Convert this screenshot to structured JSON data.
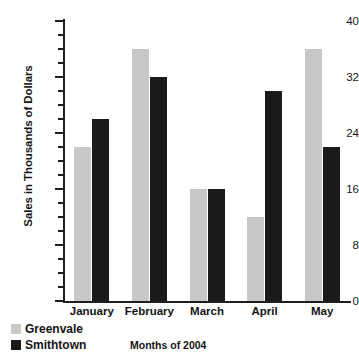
{
  "chart_data": {
    "type": "bar",
    "title": "",
    "xlabel": "Months of 2004",
    "ylabel": "Sales in Thousands of Dollars",
    "categories": [
      "January",
      "February",
      "March",
      "April",
      "May"
    ],
    "series": [
      {
        "name": "Greenvale",
        "color": "#c8c8c8",
        "values": [
          22,
          36,
          16,
          12,
          36
        ]
      },
      {
        "name": "Smithtown",
        "color": "#1a1a1a",
        "values": [
          26,
          32,
          16,
          30,
          22
        ]
      }
    ],
    "ylim": [
      0,
      40
    ],
    "y_major_ticks": [
      0,
      8,
      16,
      24,
      32,
      40
    ],
    "y_minor_tick_step": 2,
    "y_tick_labels": [
      "0",
      "8",
      "16",
      "24",
      "32",
      "40"
    ],
    "grid": false,
    "legend_position": "bottom-left"
  },
  "legend": {
    "items": [
      {
        "label": "Greenvale",
        "swatch": "greenvale"
      },
      {
        "label": "Smithtown",
        "swatch": "smithtown"
      }
    ]
  }
}
